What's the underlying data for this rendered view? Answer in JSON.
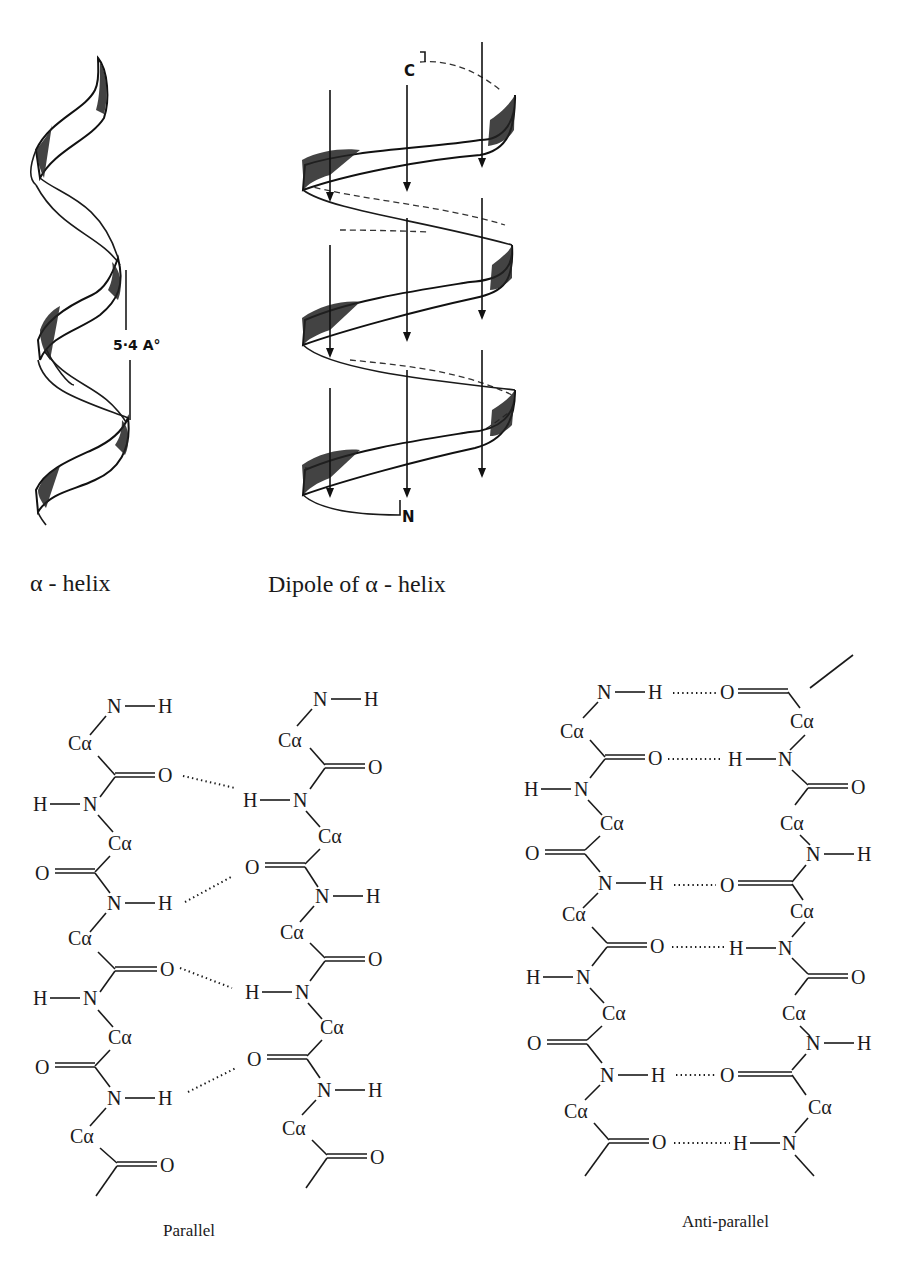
{
  "figure": {
    "alpha_helix": {
      "caption_alpha": "α",
      "caption_rest": " - helix",
      "pitch_label": "5·4 A°"
    },
    "dipole_helix": {
      "caption_prefix": "Dipole of ",
      "caption_alpha": "α",
      "caption_rest": " - helix",
      "c_terminus": "C",
      "n_terminus": "N"
    },
    "parallel_sheet": {
      "label": "Parallel",
      "atoms": {
        "N": "N",
        "H": "H",
        "O": "O",
        "C": "C",
        "alpha": "α"
      }
    },
    "antiparallel_sheet": {
      "label": "Anti-parallel"
    },
    "bottom_caption_clipped": ""
  },
  "colors": {
    "ink": "#1a1a1a",
    "background": "#ffffff"
  }
}
